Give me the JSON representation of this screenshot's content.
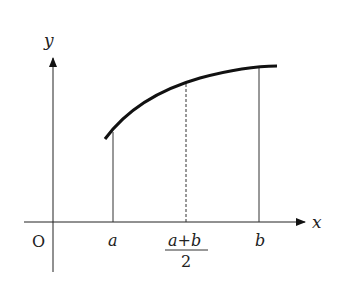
{
  "diagram": {
    "type": "function-graph",
    "axes": {
      "x_label": "x",
      "y_label": "y",
      "origin_label": "O"
    },
    "points": [
      {
        "name": "a",
        "label": "a"
      },
      {
        "name": "midpoint",
        "label_num": "a+b",
        "label_den": "2"
      },
      {
        "name": "b",
        "label": "b"
      }
    ],
    "curve": "concave increasing curve from x=a to beyond x=b",
    "lines": [
      {
        "at": "a",
        "style": "solid"
      },
      {
        "at": "(a+b)/2",
        "style": "dashed"
      },
      {
        "at": "b",
        "style": "solid"
      }
    ]
  }
}
